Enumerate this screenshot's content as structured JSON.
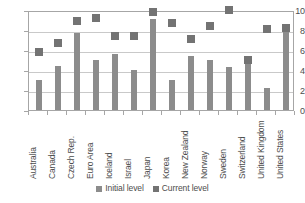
{
  "chart_data": {
    "type": "bar",
    "title": "",
    "subtitle": "",
    "xlabel": "",
    "ylabel": "",
    "ylim": [
      0,
      10
    ],
    "yticks": [
      0,
      2,
      4,
      6,
      8,
      10
    ],
    "ytick_labels": [
      "0",
      "2",
      "4",
      "6",
      "8",
      "10"
    ],
    "grid": true,
    "legend_position": "bottom",
    "categories": [
      "Australia",
      "Canada",
      "Czech Rep.",
      "Euro Area",
      "Iceland",
      "Israel",
      "Japan",
      "Korea",
      "New Zealand",
      "Norway",
      "Sweden",
      "Switzerland",
      "United Kingdom",
      "United States"
    ],
    "series": [
      {
        "name": "Initial level",
        "marker": "bar",
        "color": "#8c8c8c",
        "values": [
          3.05,
          4.4,
          7.7,
          5.0,
          5.6,
          4.05,
          9.1,
          3.05,
          5.45,
          5.0,
          4.35,
          4.8,
          2.2,
          8.2
        ]
      },
      {
        "name": "Current level",
        "marker": "square",
        "color": "#737373",
        "values": [
          5.85,
          6.75,
          8.9,
          9.2,
          7.4,
          7.4,
          9.8,
          8.75,
          7.1,
          8.45,
          10.05,
          5.0,
          8.1,
          8.25
        ]
      }
    ]
  },
  "legend": {
    "entries": [
      {
        "label": "Initial level"
      },
      {
        "label": "Current level"
      }
    ]
  },
  "colors": {
    "initial_level": "#8c8c8c",
    "current_level": "#737373",
    "gridline": "#c9c9c9",
    "axis": "#a6a6a6",
    "text": "#4d4d4d",
    "background": "#ffffff"
  }
}
